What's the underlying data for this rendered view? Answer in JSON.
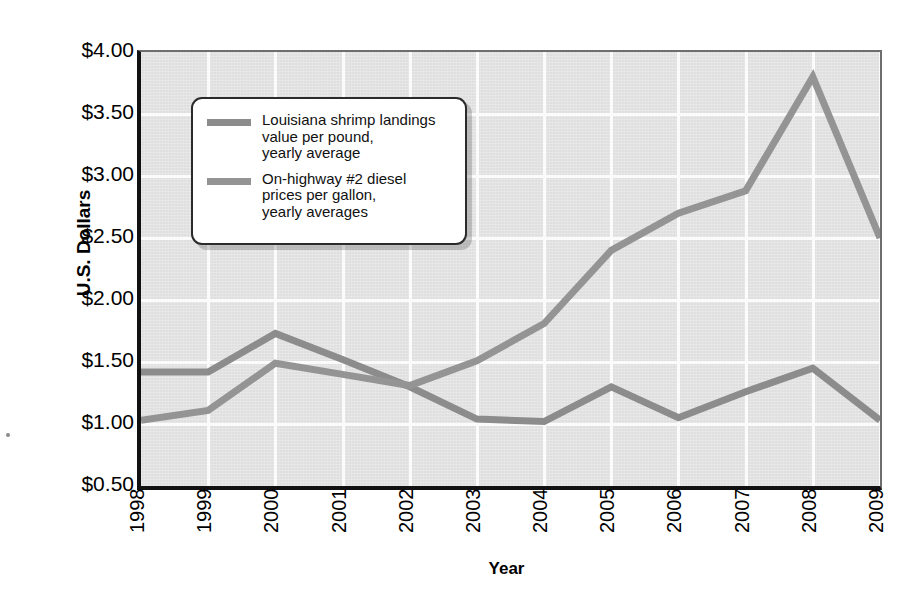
{
  "chart_data": {
    "type": "line",
    "title": "",
    "xlabel": "Year",
    "ylabel": "U.S. Dollars",
    "categories": [
      "1998",
      "1999",
      "2000",
      "2001",
      "2002",
      "2003",
      "2004",
      "2005",
      "2006",
      "2007",
      "2008",
      "2009"
    ],
    "x": [
      1998,
      1999,
      2000,
      2001,
      2002,
      2003,
      2004,
      2005,
      2006,
      2007,
      2008,
      2009
    ],
    "xlim": [
      1998,
      2009
    ],
    "ylim": [
      0.5,
      4.0
    ],
    "ytick_values": [
      4.0,
      3.5,
      3.0,
      2.5,
      2.0,
      1.5,
      1.0,
      0.5
    ],
    "ytick_labels": [
      "$4.00",
      "$3.50",
      "$3.00",
      "$2.50",
      "$2.00",
      "$1.50",
      "$1.00",
      "$0.50"
    ],
    "grid": true,
    "legend_position": "upper-left-inside",
    "series": [
      {
        "name": "Louisiana shrimp landings value per pound, yearly average",
        "legend_label": "Louisiana shrimp landings\nvalue per pound,\nyearly average",
        "color": "#8c8c8c",
        "values": [
          1.42,
          1.42,
          1.73,
          1.52,
          1.3,
          1.04,
          1.02,
          1.3,
          1.05,
          1.26,
          1.45,
          1.03
        ]
      },
      {
        "name": "On-highway #2 diesel prices per gallon, yearly averages",
        "legend_label": "On-highway #2 diesel\nprices per gallon,\nyearly averages",
        "color": "#949494",
        "values": [
          1.03,
          1.11,
          1.49,
          1.4,
          1.31,
          1.51,
          1.81,
          2.4,
          2.7,
          2.88,
          3.8,
          2.5
        ]
      }
    ]
  },
  "axes": {
    "y_title": "U.S. Dollars",
    "x_title": "Year"
  },
  "colors": {
    "plot_background": "#e3e3e3",
    "gridline": "#fbfbfb",
    "axis_line": "#111111",
    "series_shrimp": "#8c8c8c",
    "series_diesel": "#949494",
    "legend_border": "#2b2b2b",
    "legend_background": "#ffffff"
  }
}
